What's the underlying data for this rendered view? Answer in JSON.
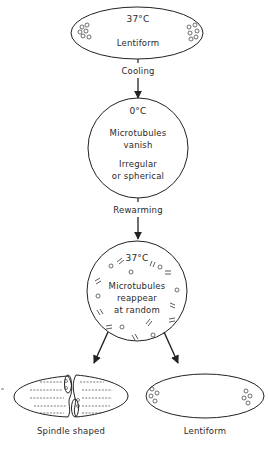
{
  "diagram": {
    "type": "flow",
    "stages": [
      {
        "id": "start",
        "temperature": "37°C",
        "shape_label": "Lentiform"
      },
      {
        "id": "cold",
        "temperature": "0°C",
        "description": "Microtubules vanish",
        "shape_label": "Irregular or spherical"
      },
      {
        "id": "rewarm",
        "temperature": "37°C",
        "description": "Microtubules reappear at random"
      },
      {
        "id": "outcome-a",
        "shape_label": "Spindle shaped"
      },
      {
        "id": "outcome-b",
        "shape_label": "Lentiform"
      }
    ],
    "transitions": [
      {
        "from": "start",
        "to": "cold",
        "label": "Cooling"
      },
      {
        "from": "cold",
        "to": "rewarm",
        "label": "Rewarming"
      },
      {
        "from": "rewarm",
        "to": "outcome-a",
        "label": ""
      },
      {
        "from": "rewarm",
        "to": "outcome-b",
        "label": ""
      }
    ]
  },
  "labels": {
    "top_temp": "37°C",
    "top_shape": "Lentiform",
    "cooling": "Cooling",
    "cold_temp": "0°C",
    "cold_line1": "Microtubules",
    "cold_line2": "vanish",
    "cold_line3": "Irregular",
    "cold_line4": "or spherical",
    "rewarming": "Rewarming",
    "warm_temp": "37°C",
    "warm_line1": "Microtubules",
    "warm_line2": "reappear",
    "warm_line3": "at random",
    "spindle": "Spindle shaped",
    "lentiform_bottom": "Lentiform"
  },
  "colors": {
    "stroke": "#222222",
    "background": "#ffffff"
  }
}
